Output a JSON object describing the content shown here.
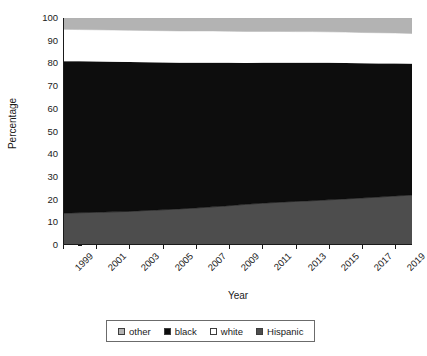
{
  "chart_data": {
    "type": "area",
    "title": "",
    "xlabel": "Year",
    "ylabel": "Percentage",
    "xlim": [
      1999,
      2020
    ],
    "ylim": [
      0,
      100
    ],
    "grid": false,
    "stacked": true,
    "legend_position": "bottom",
    "x": [
      1999,
      2000,
      2001,
      2002,
      2003,
      2004,
      2005,
      2006,
      2007,
      2008,
      2009,
      2010,
      2011,
      2012,
      2013,
      2014,
      2015,
      2016,
      2017,
      2018,
      2019,
      2020
    ],
    "xticklabels": [
      "1999",
      "2001",
      "2003",
      "2005",
      "2007",
      "2009",
      "2011",
      "2013",
      "2015",
      "2017",
      "2019"
    ],
    "xtickvalues": [
      1999,
      2001,
      2003,
      2005,
      2007,
      2009,
      2011,
      2013,
      2015,
      2017,
      2019
    ],
    "yticklabels": [
      "0",
      "10",
      "20",
      "30",
      "40",
      "50",
      "60",
      "70",
      "80",
      "90",
      "100"
    ],
    "ytickvalues": [
      0,
      10,
      20,
      30,
      40,
      50,
      60,
      70,
      80,
      90,
      100
    ],
    "series": [
      {
        "name": "Hispanic",
        "color": "#4d4d4d",
        "values": [
          14.0,
          14.2,
          14.4,
          14.6,
          14.8,
          15.2,
          15.5,
          15.9,
          16.3,
          16.8,
          17.3,
          17.9,
          18.4,
          18.8,
          19.2,
          19.5,
          19.9,
          20.3,
          20.7,
          21.1,
          21.6,
          22.0
        ]
      },
      {
        "name": "black",
        "color": "#0d0d0d",
        "values": [
          67.0,
          66.7,
          66.4,
          66.1,
          65.8,
          65.3,
          64.9,
          64.4,
          64.0,
          63.5,
          63.0,
          62.3,
          61.9,
          61.5,
          61.1,
          60.8,
          60.4,
          59.9,
          59.4,
          58.9,
          58.4,
          57.9
        ]
      },
      {
        "name": "white",
        "color": "#ffffff",
        "values": [
          14.0,
          14.0,
          14.0,
          14.0,
          14.0,
          14.0,
          14.0,
          14.0,
          14.0,
          14.0,
          13.9,
          13.9,
          13.8,
          13.8,
          13.7,
          13.7,
          13.6,
          13.6,
          13.5,
          13.5,
          13.4,
          13.3
        ]
      },
      {
        "name": "other",
        "color": "#b3b3b3",
        "values": [
          5.0,
          5.1,
          5.2,
          5.3,
          5.4,
          5.5,
          5.6,
          5.7,
          5.7,
          5.7,
          5.8,
          5.9,
          5.9,
          5.9,
          6.0,
          6.0,
          6.1,
          6.2,
          6.4,
          6.5,
          6.6,
          6.8
        ]
      }
    ],
    "legend_order": [
      "other",
      "black",
      "white",
      "Hispanic"
    ]
  },
  "axes": {
    "y_label": "Percentage",
    "x_label": "Year"
  },
  "legend": {
    "items": [
      {
        "label": "other",
        "color": "#b3b3b3"
      },
      {
        "label": "black",
        "color": "#0d0d0d"
      },
      {
        "label": "white",
        "color": "#ffffff"
      },
      {
        "label": "Hispanic",
        "color": "#4d4d4d"
      }
    ]
  }
}
